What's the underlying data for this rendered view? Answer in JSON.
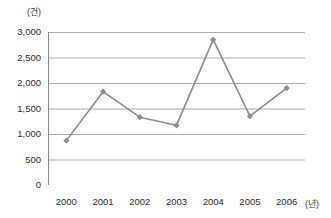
{
  "chart_data": {
    "type": "line",
    "title": "",
    "subtitle": "",
    "xlabel": "(년)",
    "ylabel": "(건)",
    "categories": [
      "2000",
      "2001",
      "2002",
      "2003",
      "2004",
      "2005",
      "2006"
    ],
    "values": [
      870,
      1830,
      1330,
      1170,
      2850,
      1350,
      1900
    ],
    "series": [
      {
        "name": "",
        "values": [
          870,
          1830,
          1330,
          1170,
          2850,
          1350,
          1900
        ]
      }
    ],
    "ylim": [
      0,
      3000
    ],
    "ytick_values": [
      0,
      500,
      1000,
      1500,
      2000,
      2500,
      3000
    ],
    "ytick_labels": [
      "0",
      "500",
      "1,000",
      "1,500",
      "2,000",
      "2,500",
      "3,000"
    ],
    "grid": "horizontal",
    "legend": "none",
    "marker": "diamond",
    "colors": {
      "line": "#8c8c8c",
      "marker": "#8c8c8c",
      "grid": "#aaaaaa",
      "axis": "#8a8a8a",
      "text": "#2b2b2b",
      "background": "#ffffff"
    }
  }
}
